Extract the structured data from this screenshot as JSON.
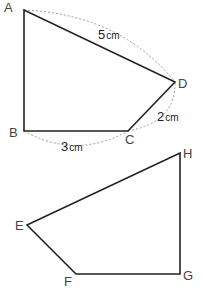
{
  "figures": [
    {
      "id": "ABCD",
      "vertices": {
        "A": {
          "label": "A",
          "x": 24,
          "y": 10
        },
        "B": {
          "label": "B",
          "x": 24,
          "y": 131
        },
        "C": {
          "label": "C",
          "x": 128,
          "y": 131
        },
        "D": {
          "label": "D",
          "x": 175,
          "y": 82
        }
      },
      "measurements": {
        "AD": {
          "value": "5",
          "unit": "cm"
        },
        "CD": {
          "value": "2",
          "unit": "cm"
        },
        "BC": {
          "value": "3",
          "unit": "cm"
        }
      }
    },
    {
      "id": "EFGH",
      "vertices": {
        "E": {
          "label": "E",
          "x": 27,
          "y": 225
        },
        "F": {
          "label": "F",
          "x": 76,
          "y": 274
        },
        "G": {
          "label": "G",
          "x": 180,
          "y": 274
        },
        "H": {
          "label": "H",
          "x": 180,
          "y": 153
        }
      }
    }
  ],
  "colors": {
    "line": "#222222",
    "dashed": "#999999",
    "label": "#444444",
    "background": "#ffffff"
  }
}
